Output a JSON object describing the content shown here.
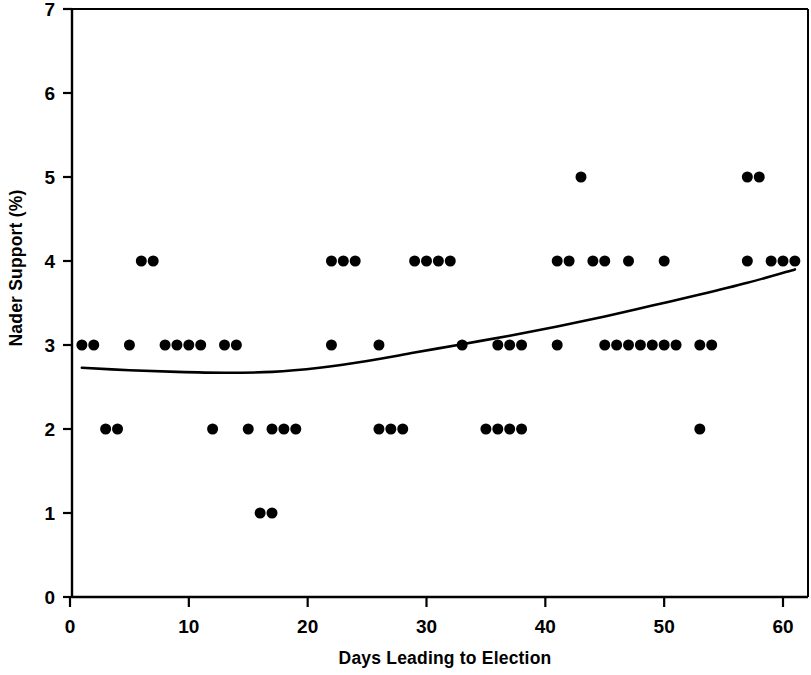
{
  "chart_data": {
    "type": "scatter",
    "title": "",
    "subtitle": "",
    "xlabel": "Days Leading to Election",
    "ylabel": "Nader Support (%)",
    "xlim": [
      0,
      62
    ],
    "ylim": [
      0,
      7
    ],
    "xticks": [
      0,
      10,
      20,
      30,
      40,
      50,
      60
    ],
    "xtick_labels": [
      "0",
      "10",
      "20",
      "30",
      "40",
      "50",
      "60"
    ],
    "yticks": [
      0,
      1,
      2,
      3,
      4,
      5,
      6,
      7
    ],
    "ytick_labels": [
      "0",
      "1",
      "2",
      "3",
      "4",
      "5",
      "6",
      "7"
    ],
    "grid": false,
    "legend": null,
    "legend_position": "none",
    "marker": "filled-circle",
    "marker_color": "#000000",
    "marker_size": 11,
    "series": [
      {
        "name": "Nader support poll observations",
        "type": "scatter",
        "points": [
          [
            1,
            3
          ],
          [
            2,
            3
          ],
          [
            3,
            2
          ],
          [
            4,
            2
          ],
          [
            5,
            3
          ],
          [
            6,
            4
          ],
          [
            7,
            4
          ],
          [
            8,
            3
          ],
          [
            9,
            3
          ],
          [
            10,
            3
          ],
          [
            11,
            3
          ],
          [
            12,
            2
          ],
          [
            13,
            3
          ],
          [
            14,
            3
          ],
          [
            15,
            2
          ],
          [
            16,
            1
          ],
          [
            17,
            1
          ],
          [
            17,
            2
          ],
          [
            18,
            2
          ],
          [
            19,
            2
          ],
          [
            22,
            3
          ],
          [
            22,
            4
          ],
          [
            23,
            4
          ],
          [
            24,
            4
          ],
          [
            26,
            3
          ],
          [
            26,
            2
          ],
          [
            27,
            2
          ],
          [
            28,
            2
          ],
          [
            29,
            4
          ],
          [
            30,
            4
          ],
          [
            31,
            4
          ],
          [
            32,
            4
          ],
          [
            33,
            3
          ],
          [
            35,
            2
          ],
          [
            36,
            2
          ],
          [
            36,
            3
          ],
          [
            37,
            3
          ],
          [
            38,
            3
          ],
          [
            37,
            2
          ],
          [
            38,
            2
          ],
          [
            41,
            3
          ],
          [
            41,
            4
          ],
          [
            42,
            4
          ],
          [
            43,
            5
          ],
          [
            44,
            4
          ],
          [
            45,
            4
          ],
          [
            45,
            3
          ],
          [
            46,
            3
          ],
          [
            47,
            4
          ],
          [
            47,
            3
          ],
          [
            48,
            3
          ],
          [
            49,
            3
          ],
          [
            50,
            4
          ],
          [
            50,
            3
          ],
          [
            51,
            3
          ],
          [
            53,
            2
          ],
          [
            53,
            3
          ],
          [
            54,
            3
          ],
          [
            57,
            4
          ],
          [
            57,
            5
          ],
          [
            58,
            5
          ],
          [
            59,
            4
          ],
          [
            60,
            4
          ],
          [
            61,
            4
          ]
        ]
      },
      {
        "name": "Smoothed trend line",
        "type": "line",
        "color": "#000000",
        "linewidth": 2.6,
        "points": [
          [
            1,
            2.73
          ],
          [
            5,
            2.7
          ],
          [
            9,
            2.68
          ],
          [
            13,
            2.67
          ],
          [
            17,
            2.68
          ],
          [
            21,
            2.73
          ],
          [
            25,
            2.81
          ],
          [
            29,
            2.91
          ],
          [
            33,
            3.01
          ],
          [
            37,
            3.11
          ],
          [
            41,
            3.22
          ],
          [
            45,
            3.34
          ],
          [
            49,
            3.47
          ],
          [
            53,
            3.6
          ],
          [
            57,
            3.74
          ],
          [
            61,
            3.9
          ]
        ]
      }
    ]
  },
  "figure": {
    "background_color": "#ffffff",
    "axis_color": "#000000",
    "frame": "box"
  }
}
